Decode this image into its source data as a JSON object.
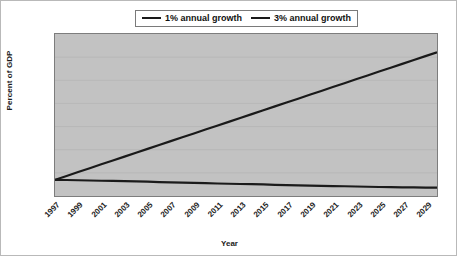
{
  "chart_data": {
    "type": "line",
    "title": "",
    "xlabel": "Year",
    "ylabel": "Percent of GDP",
    "x": [
      1997,
      1998,
      1999,
      2000,
      2001,
      2002,
      2003,
      2004,
      2005,
      2006,
      2007,
      2008,
      2009,
      2010,
      2011,
      2012,
      2013,
      2014,
      2015,
      2016,
      2017,
      2018,
      2019,
      2020,
      2021,
      2022,
      2023,
      2024,
      2025,
      2026,
      2027,
      2028,
      2029,
      2030
    ],
    "xlim": [
      1997,
      2030
    ],
    "ylim": [
      30,
      65
    ],
    "yticks": [
      30,
      35,
      40,
      45,
      50,
      55,
      60,
      65
    ],
    "xticks": [
      1997,
      1999,
      2001,
      2003,
      2005,
      2007,
      2009,
      2011,
      2013,
      2015,
      2017,
      2019,
      2021,
      2023,
      2025,
      2027,
      2029
    ],
    "grid": true,
    "legend_position": "top-center",
    "series": [
      {
        "name": "1% annual growth",
        "color": "#1a1a1a",
        "values": [
          33.5,
          33.45,
          33.4,
          33.35,
          33.3,
          33.25,
          33.2,
          33.15,
          33.1,
          33.0,
          32.95,
          32.9,
          32.85,
          32.8,
          32.7,
          32.65,
          32.6,
          32.55,
          32.5,
          32.4,
          32.35,
          32.3,
          32.25,
          32.2,
          32.15,
          32.1,
          32.05,
          32.0,
          31.95,
          31.9,
          31.88,
          31.85,
          31.82,
          31.8
        ]
      },
      {
        "name": "3% annual growth",
        "color": "#1a1a1a",
        "values": [
          33.5,
          34.33,
          35.17,
          36.0,
          36.84,
          37.67,
          38.51,
          39.34,
          40.18,
          41.01,
          41.85,
          42.68,
          43.52,
          44.35,
          45.19,
          46.02,
          46.86,
          47.69,
          48.53,
          49.36,
          50.2,
          51.03,
          51.87,
          52.7,
          53.54,
          54.37,
          55.21,
          56.04,
          56.88,
          57.71,
          58.55,
          59.38,
          60.22,
          61.05
        ]
      }
    ]
  },
  "legend": {
    "entries": [
      {
        "label": "1% annual growth"
      },
      {
        "label": "3% annual growth"
      }
    ]
  },
  "axes": {
    "y_title": "Percent of GDP",
    "x_title": "Year",
    "y_tick_labels": [
      "65",
      "60",
      "55",
      "50",
      "45",
      "40",
      "35",
      "30"
    ],
    "x_tick_labels": [
      "1997",
      "1999",
      "2001",
      "2003",
      "2005",
      "2007",
      "2009",
      "2011",
      "2013",
      "2015",
      "2017",
      "2019",
      "2021",
      "2023",
      "2025",
      "2027",
      "2029"
    ]
  },
  "colors": {
    "plot_background": "#c2c2c2",
    "page_background": "#ffffff",
    "line": "#1a1a1a",
    "axis": "#7d7d7d",
    "gridline": "#b4b4b4"
  }
}
